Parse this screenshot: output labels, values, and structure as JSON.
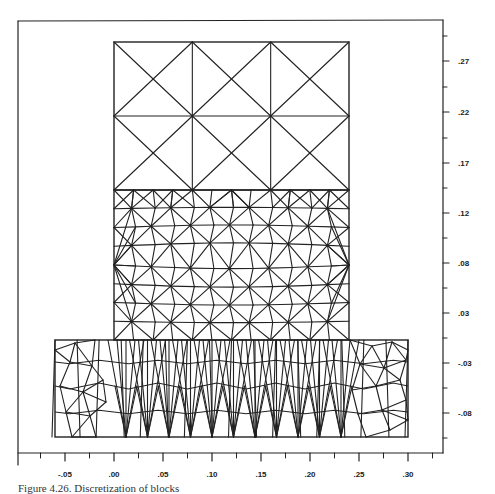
{
  "figure": {
    "caption": "Figure 4.26. Discretization of blocks",
    "type": "finite-element mesh diagram"
  },
  "axes": {
    "x": {
      "ticks": [
        -0.05,
        0.0,
        0.05,
        0.1,
        0.15,
        0.2,
        0.25,
        0.3
      ],
      "tick_labels": [
        "-.05",
        ".00",
        ".05",
        ".10",
        ".15",
        ".20",
        ".25",
        ".30"
      ],
      "range": [
        -0.1,
        0.33
      ]
    },
    "y": {
      "ticks": [
        0.27,
        0.22,
        0.17,
        0.12,
        0.08,
        0.03,
        -0.03,
        -0.08
      ],
      "tick_labels": [
        ".27",
        ".22",
        ".17",
        ".12",
        ".08",
        ".03",
        "-.03",
        "-.08"
      ],
      "position": "right"
    }
  },
  "blocks": [
    {
      "name": "upper-block",
      "mesh": "coarse",
      "x_range": [
        0.0,
        0.24
      ],
      "y_range": [
        0.14,
        0.29
      ],
      "cols": 3,
      "rows": 2,
      "pattern": "crossed-diagonals"
    },
    {
      "name": "middle-block",
      "mesh": "fine-triangular",
      "x_range": [
        0.0,
        0.24
      ],
      "y_range": [
        -0.01,
        0.14
      ]
    },
    {
      "name": "base-block",
      "mesh": "fine-triangular",
      "x_range": [
        -0.06,
        0.3
      ],
      "y_range": [
        -0.107,
        -0.01
      ]
    }
  ],
  "colors": {
    "line": "#222222",
    "background": "#ffffff"
  }
}
